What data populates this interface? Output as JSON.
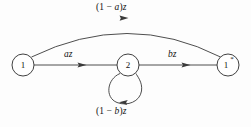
{
  "diagram": {
    "nodes": [
      {
        "id": "n1",
        "label": "1",
        "star": "",
        "cx": 23,
        "cy": 65,
        "r": 11
      },
      {
        "id": "n2",
        "label": "2",
        "star": "",
        "cx": 128,
        "cy": 65,
        "r": 11
      },
      {
        "id": "n1s",
        "label": "1",
        "star": "*",
        "cx": 228,
        "cy": 65,
        "r": 11
      }
    ],
    "edges": [
      {
        "id": "e-top",
        "from": "1",
        "to": "1*",
        "label": "(1 − a)z"
      },
      {
        "id": "e-left",
        "from": "1",
        "to": "2",
        "label": "az"
      },
      {
        "id": "e-right",
        "from": "2",
        "to": "1*",
        "label": "bz"
      },
      {
        "id": "e-loop",
        "from": "2",
        "to": "2",
        "label": "(1 − b)z"
      }
    ],
    "labels": {
      "top": "(1 − a)z",
      "left": "az",
      "right": "bz",
      "bottom": "(1 − b)z"
    },
    "colors": {
      "stroke": "#3a3a3a",
      "node_stroke": "#2b2b2b",
      "text": "#111111",
      "background": "#fdfdfd"
    }
  }
}
